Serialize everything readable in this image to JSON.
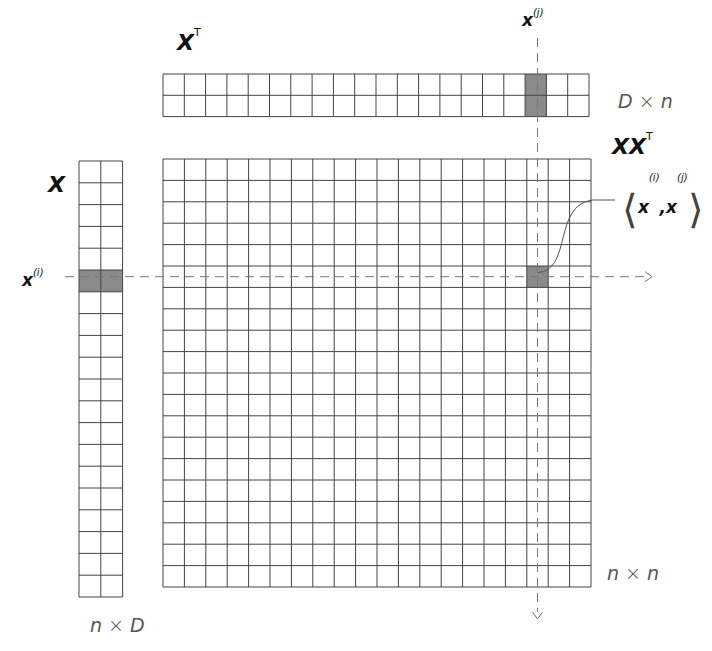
{
  "labels": {
    "xt": {
      "base": "X",
      "sup": "T"
    },
    "x": {
      "base": "X"
    },
    "xxt": {
      "base": "XX",
      "sup": "T"
    },
    "xj": {
      "base": "x",
      "sup": "(j)"
    },
    "xi": {
      "base": "x",
      "sup": "(i)"
    },
    "inner": {
      "left": "⟨",
      "a": "x",
      "a_sup": "(i)",
      "comma": ",",
      "b": "x",
      "b_sup": "(j)",
      "right": "⟩"
    },
    "dim_top": {
      "a": "D",
      "op": " × ",
      "b": "n"
    },
    "dim_left": {
      "a": "n",
      "op": " × ",
      "b": "D"
    },
    "dim_big": {
      "a": "n",
      "op": " × ",
      "b": "n"
    }
  },
  "grids": {
    "xt": {
      "x": 163,
      "y": 74,
      "cols": 20,
      "rows": 2,
      "cell": 21.3,
      "shaded_col": 17
    },
    "x": {
      "x": 79,
      "y": 161,
      "cols": 2,
      "rows": 20,
      "cell": 21.8,
      "shaded_row": 5
    },
    "xxt": {
      "x": 163,
      "y": 159,
      "cols": 20,
      "rows": 20,
      "cell": 21.4,
      "shaded_row": 5,
      "shaded_col": 17
    }
  },
  "colors": {
    "line": "#444444",
    "shade": "#8a8a8a",
    "dash": "#777777"
  }
}
